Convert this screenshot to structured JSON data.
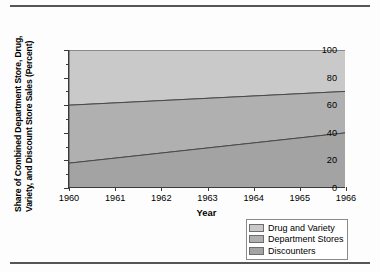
{
  "figure": {
    "has_top_rule": true,
    "has_bottom_rule": true
  },
  "axes": {
    "ylabel_line1": "Share of Combined Department Store, Drug,",
    "ylabel_line2": "Variety, and Discount Store Sales (Percent)",
    "xlabel": "Year",
    "ytick_labels": [
      "0",
      "20",
      "40",
      "60",
      "80",
      "100"
    ],
    "ytick_values": [
      0,
      20,
      40,
      60,
      80,
      100
    ],
    "yminor_values": [
      10,
      30,
      50,
      70,
      90
    ],
    "xtick_labels": [
      "1960",
      "1961",
      "1962",
      "1963",
      "1964",
      "1965",
      "1966"
    ]
  },
  "legend": {
    "items": [
      {
        "label": "Drug and Variety",
        "color": "#c9c9c9"
      },
      {
        "label": "Department Stores",
        "color": "#b0b0b0"
      },
      {
        "label": "Discounters",
        "color": "#a3a3a3"
      }
    ]
  },
  "chart_data": {
    "type": "area",
    "title": "",
    "subtitle": "",
    "xlabel": "Year",
    "ylabel": "Share of Combined Department Store, Drug, Variety, and Discount Store Sales (Percent)",
    "stacked": true,
    "normalized_to_100": true,
    "grid": false,
    "legend_position": "bottom-right",
    "x": [
      1960,
      1966
    ],
    "xlim": [
      1960,
      1966
    ],
    "ylim": [
      0,
      100
    ],
    "xticks": [
      1960,
      1961,
      1962,
      1963,
      1964,
      1965,
      1966
    ],
    "yticks": [
      0,
      20,
      40,
      60,
      80,
      100
    ],
    "yticks_minor": [
      10,
      30,
      50,
      70,
      90
    ],
    "series": [
      {
        "name": "Discounters",
        "order": "bottom",
        "color": "#a3a3a3",
        "values": [
          18,
          40
        ],
        "cumulative_top": [
          18,
          40
        ]
      },
      {
        "name": "Department Stores",
        "order": "middle",
        "color": "#b0b0b0",
        "values": [
          42,
          30
        ],
        "cumulative_top": [
          60,
          70
        ]
      },
      {
        "name": "Drug and Variety",
        "order": "top",
        "color": "#c9c9c9",
        "values": [
          40,
          30
        ],
        "cumulative_top": [
          100,
          100
        ]
      }
    ],
    "boundaries": {
      "discounters_top": {
        "1960": 18,
        "1966": 40
      },
      "department_stores_top": {
        "1960": 60,
        "1966": 70
      },
      "total_top": {
        "1960": 100,
        "1966": 100
      }
    },
    "annotations": []
  }
}
